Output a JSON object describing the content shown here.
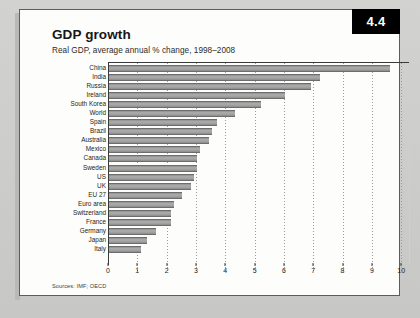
{
  "badge": {
    "label": "4.4"
  },
  "header": {
    "title": "GDP growth",
    "subtitle": "Real GDP, average annual % change, 1998–2008"
  },
  "footer": {
    "sources": "Sources: IMF; OECD"
  },
  "colors": {
    "bar_fill": "#a0a0a0",
    "bar_edge": "#6d6d6d",
    "axis": "#3a3a3a",
    "grid": "#9a9a9a",
    "badge_bg": "#000000",
    "badge_text": "#ffffff",
    "card_bg": "#fdfdfb",
    "page_bg": "#cfcfcd"
  },
  "chart_data": {
    "type": "bar",
    "orientation": "horizontal",
    "title": "GDP growth",
    "subtitle": "Real GDP, average annual % change, 1998–2008",
    "xlabel": "",
    "ylabel": "",
    "xlim": [
      0,
      10.3
    ],
    "grid": true,
    "legend": false,
    "xticks": [
      0,
      1,
      2,
      3,
      4,
      5,
      6,
      7,
      8,
      9,
      10
    ],
    "xticklabels": [
      "0",
      "1",
      "2",
      "3",
      "4",
      "5",
      "6",
      "7",
      "8",
      "9",
      "10"
    ],
    "categories": [
      "China",
      "India",
      "Russia",
      "Ireland",
      "South Korea",
      "World",
      "Spain",
      "Brazil",
      "Australia",
      "Mexico",
      "Canada",
      "Sweden",
      "US",
      "UK",
      "EU 27",
      "Euro area",
      "Switzerland",
      "France",
      "Germany",
      "Japan",
      "Italy"
    ],
    "values": [
      9.6,
      7.2,
      6.9,
      6.0,
      5.2,
      4.3,
      3.7,
      3.5,
      3.4,
      3.1,
      3.0,
      3.0,
      2.9,
      2.8,
      2.5,
      2.2,
      2.1,
      2.1,
      1.6,
      1.3,
      1.1
    ],
    "source": "Sources: IMF; OECD"
  }
}
